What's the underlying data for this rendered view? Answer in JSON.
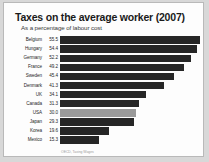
{
  "chart_data": {
    "type": "bar",
    "orientation": "horizontal",
    "title": "Taxes on the average worker (2007)",
    "subtitle": "As a percentage of labour cost",
    "xlabel": "",
    "ylabel": "",
    "xlim": [
      0,
      56
    ],
    "grid": false,
    "legend": null,
    "source": "OECD, Taxing Wages",
    "value_labels_shown": true,
    "categories": [
      "Belgium",
      "Hungary",
      "Germany",
      "France",
      "Sweden",
      "Denmark",
      "UK",
      "Canada",
      "USA",
      "Japan",
      "Korea",
      "Mexico"
    ],
    "values": [
      55.5,
      54.4,
      52.2,
      49.2,
      45.4,
      41.3,
      34.1,
      31.3,
      30.0,
      29.3,
      19.6,
      15.3
    ],
    "value_text": [
      "55.5",
      "54.4",
      "52.2",
      "49.2",
      "45.4",
      "41.3",
      "34.1",
      "31.3",
      "30.0",
      "29.3",
      "19.6",
      "15.3"
    ],
    "highlight_category": "USA",
    "colors": {
      "bar": "#262626",
      "bar_highlight": "#9a9a9a",
      "text": "#1d1d1d",
      "title": "#1a1a1a",
      "card": "#fdfdfd",
      "page_background": "#d8d8d8",
      "border": "#b9b9b9"
    }
  }
}
